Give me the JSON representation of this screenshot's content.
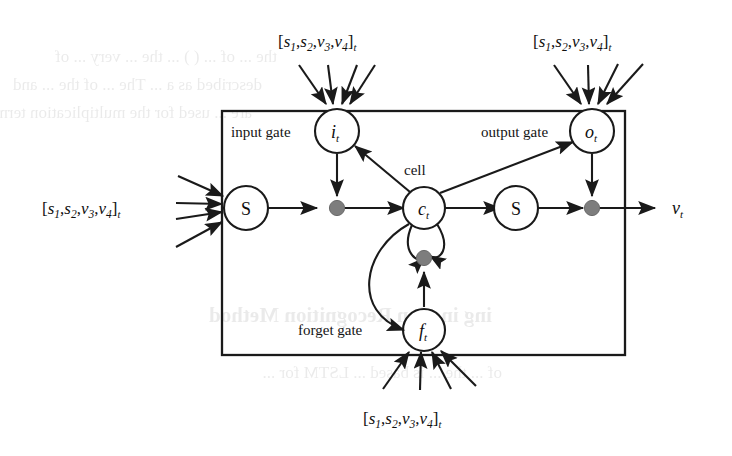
{
  "figure": {
    "kind": "lstm-memory-block-diagram",
    "outer_box": {
      "present": true,
      "stroke": "#1a1a1a"
    },
    "labels": {
      "input_gate": "input gate",
      "output_gate": "output gate",
      "forget_gate": "forget gate",
      "cell": "cell"
    },
    "nodes": {
      "input_gate_node": {
        "base": "i",
        "sub": "t"
      },
      "output_gate_node": {
        "base": "o",
        "sub": "t"
      },
      "forget_gate_node": {
        "base": "f",
        "sub": "t"
      },
      "cell_node": {
        "base": "c",
        "sub": "t"
      },
      "squash_in": {
        "label": "S"
      },
      "squash_out": {
        "label": "S"
      }
    },
    "input_vector": {
      "open": "[",
      "s1": "s",
      "s1sub": "1",
      "s2": "s",
      "s2sub": "2",
      "v3": "v",
      "v3sub": "3",
      "v4": "v",
      "v4sub": "4",
      "close": "]",
      "time_sub": "t",
      "comma": ",",
      "occurrences": 4,
      "positions": [
        "top-left-of-input-gate",
        "top-right-of-output-gate",
        "left-of-squash-in",
        "bottom-of-forget-gate"
      ]
    },
    "output": {
      "base": "v",
      "sub": "t"
    },
    "multiplication_dots": {
      "count": 3,
      "color": "#7d7d7d",
      "names": [
        "input-multiply-dot",
        "recurrent-multiply-dot",
        "output-multiply-dot"
      ]
    },
    "arrow_counts": {
      "per_input_vector": 4
    },
    "colors": {
      "ink": "#1a1a1a",
      "dot_gray": "#7d7d7d",
      "paper": "#ffffff",
      "bleed_through": "#1a1a1a"
    }
  },
  "background_bleed": {
    "note": "faint mirrored show-through text from reverse page of scan",
    "lines": [
      "the ... of ... ( ) ... the ... very ... of",
      "described as a ... The ... of the ... and",
      "are ... used for the multiplication terms",
      "ing inction Recognition Method",
      "of ... the ... is based ... LSTM for ..."
    ]
  }
}
